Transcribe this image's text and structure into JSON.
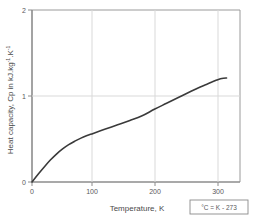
{
  "chart_data": {
    "type": "line",
    "title": "",
    "xlabel": "Temperature,  K",
    "ylabel": "Heat capacity, Cp in kJ.kg",
    "ylabel_sup1": "-1",
    "ylabel_mid": ".kg",
    "ylabel_unit_k": ".K",
    "ylabel_sup2": "-1",
    "ylabel_full": "Heat capacity, Cp in kJ.kg-1.K-1",
    "xlim": [
      0,
      340
    ],
    "ylim": [
      0,
      2
    ],
    "xticks": [
      0,
      100,
      200,
      300
    ],
    "xtick_labels": [
      "0",
      "100",
      "200",
      "300"
    ],
    "yticks": [
      0,
      1,
      2
    ],
    "ytick_labels": [
      "0",
      "1",
      "2"
    ],
    "grid": true,
    "grid_color": "#d9d9d9",
    "legend": null,
    "series": [
      {
        "name": "Cp",
        "color": "#3a3a3a",
        "x": [
          0,
          10,
          20,
          30,
          40,
          50,
          60,
          70,
          80,
          90,
          100,
          120,
          140,
          160,
          180,
          200,
          220,
          240,
          260,
          275,
          285,
          295,
          302,
          308,
          313,
          318
        ],
        "y": [
          0.0,
          0.09,
          0.175,
          0.255,
          0.325,
          0.385,
          0.435,
          0.475,
          0.51,
          0.54,
          0.565,
          0.615,
          0.665,
          0.715,
          0.77,
          0.845,
          0.915,
          0.985,
          1.055,
          1.105,
          1.135,
          1.165,
          1.185,
          1.2,
          1.207,
          1.21
        ]
      }
    ],
    "annotations": [
      {
        "name": "conversion-note",
        "text": "°C = K - 273",
        "boxed": true,
        "border_color": "#8a8a8a"
      }
    ]
  },
  "axis": {
    "x_title": "Temperature,  K",
    "y_title_main": "Heat capacity, Cp in kJ.kg",
    "y_title_exp1": "-1",
    "y_title_mid": ".K",
    "y_title_exp2": "-1"
  },
  "note": {
    "text": "°C = K - 273"
  },
  "colors": {
    "curve": "#3a3a3a",
    "grid": "#d9d9d9",
    "axis": "#8c8c8c",
    "text": "#4a4a4a",
    "background": "#ffffff"
  }
}
